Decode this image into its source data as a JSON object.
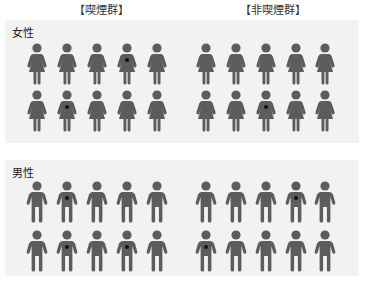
{
  "headers": {
    "smoking": "【喫煙群】",
    "non_smoking": "【非喫煙群】"
  },
  "colors": {
    "figure": "#5c5c5c",
    "marker": "#111111",
    "section_bg": "#f2f2f2"
  },
  "sections": [
    {
      "label": "女性",
      "gender": "female",
      "groups": {
        "smoking": {
          "rows": [
            [
              0,
              0,
              0,
              1,
              0
            ],
            [
              0,
              1,
              0,
              0,
              0
            ]
          ]
        },
        "non_smoking": {
          "rows": [
            [
              0,
              0,
              0,
              0,
              0
            ],
            [
              0,
              0,
              1,
              0,
              0
            ]
          ]
        }
      }
    },
    {
      "label": "男性",
      "gender": "male",
      "groups": {
        "smoking": {
          "rows": [
            [
              0,
              1,
              0,
              0,
              0
            ],
            [
              0,
              1,
              0,
              1,
              0
            ]
          ]
        },
        "non_smoking": {
          "rows": [
            [
              0,
              0,
              0,
              1,
              0
            ],
            [
              1,
              0,
              0,
              0,
              0
            ]
          ]
        }
      }
    }
  ]
}
